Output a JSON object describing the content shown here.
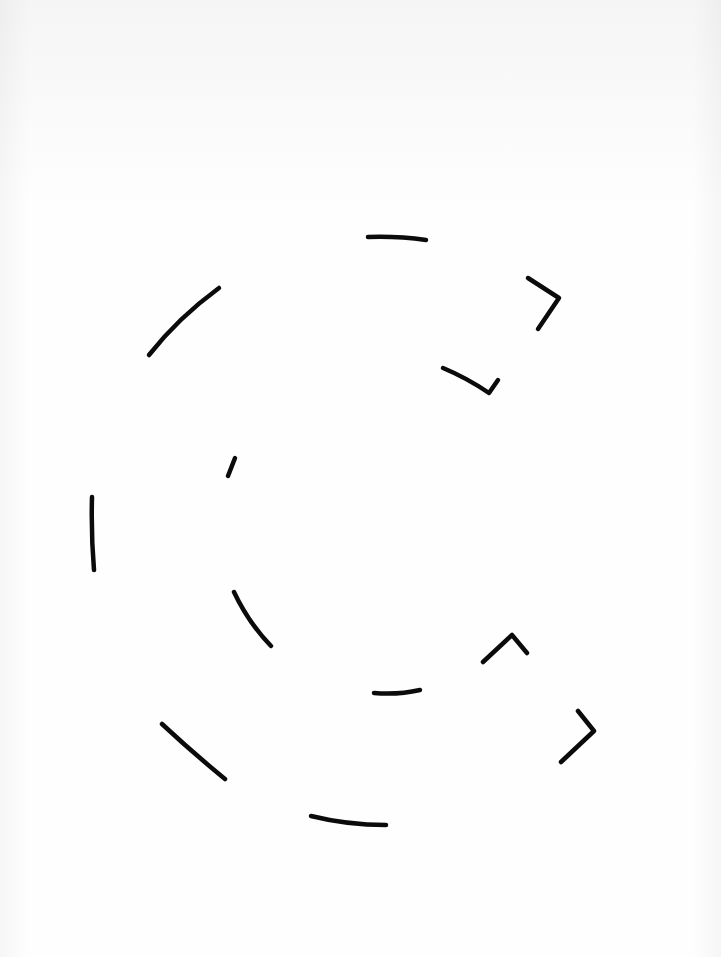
{
  "diagram": {
    "ink_color": "#0b0b0b",
    "paper_color": "#fefefe",
    "rings": [
      {
        "name": "outer-ring",
        "direction": "clockwise",
        "dash_count": 7,
        "arrowheads": 2
      },
      {
        "name": "inner-ring",
        "direction": "clockwise",
        "dash_count": 5,
        "arrowheads": 2
      }
    ]
  }
}
